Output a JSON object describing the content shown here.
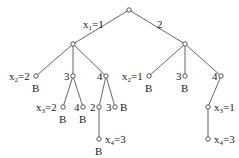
{
  "diagram": {
    "type": "search-tree",
    "nodes": [
      {
        "id": "root",
        "x": 129,
        "y": 10
      },
      {
        "id": "n1",
        "x": 73,
        "y": 44
      },
      {
        "id": "n2",
        "x": 185,
        "y": 44
      },
      {
        "id": "n11",
        "x": 36,
        "y": 76
      },
      {
        "id": "n12",
        "x": 73,
        "y": 76
      },
      {
        "id": "n13",
        "x": 106,
        "y": 76
      },
      {
        "id": "n21",
        "x": 149,
        "y": 76
      },
      {
        "id": "n22",
        "x": 185,
        "y": 76
      },
      {
        "id": "n23",
        "x": 221,
        "y": 76
      },
      {
        "id": "n121",
        "x": 63,
        "y": 107
      },
      {
        "id": "n122",
        "x": 83,
        "y": 107
      },
      {
        "id": "n131",
        "x": 99,
        "y": 107
      },
      {
        "id": "n132",
        "x": 115,
        "y": 107
      },
      {
        "id": "n1311",
        "x": 99,
        "y": 139
      },
      {
        "id": "n231",
        "x": 208,
        "y": 107
      },
      {
        "id": "n2311",
        "x": 208,
        "y": 139
      }
    ],
    "edges": [
      [
        "root",
        "n1"
      ],
      [
        "root",
        "n2"
      ],
      [
        "n1",
        "n11"
      ],
      [
        "n1",
        "n12"
      ],
      [
        "n1",
        "n13"
      ],
      [
        "n2",
        "n21"
      ],
      [
        "n2",
        "n22"
      ],
      [
        "n2",
        "n23"
      ],
      [
        "n12",
        "n121"
      ],
      [
        "n12",
        "n122"
      ],
      [
        "n13",
        "n131"
      ],
      [
        "n13",
        "n132"
      ],
      [
        "n131",
        "n1311"
      ],
      [
        "n23",
        "n231"
      ],
      [
        "n231",
        "n2311"
      ]
    ],
    "labels": {
      "edge_x1_1": {
        "var": "x",
        "sub": "1",
        "rest": "=1"
      },
      "edge_2": "2",
      "n11": {
        "var": "x",
        "sub": "2",
        "rest": "=2"
      },
      "n12": "3",
      "n13": "4",
      "n21": {
        "var": "x",
        "sub": "2",
        "rest": "=1"
      },
      "n22": "3",
      "n23": "4",
      "n121": {
        "var": "x",
        "sub": "3",
        "rest": "=2"
      },
      "n122": "4",
      "n131": "2",
      "n132": "3",
      "n1311": {
        "var": "x",
        "sub": "4",
        "rest": "=3"
      },
      "n231": {
        "var": "x",
        "sub": "3",
        "rest": "=1"
      },
      "n2311": {
        "var": "x",
        "sub": "4",
        "rest": "=3"
      }
    },
    "bound_marker": "B"
  }
}
